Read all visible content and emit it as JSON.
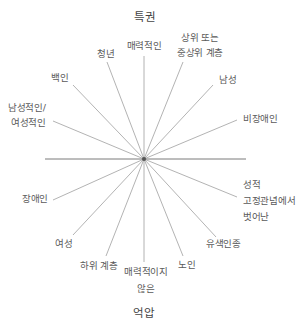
{
  "axis": {
    "top": "특권",
    "bottom": "억압"
  },
  "labels": {
    "attractive": "매력적인",
    "young": "청년",
    "upper_class_line1": "상위 또는",
    "upper_class_line2": "중상위 계층",
    "white": "백인",
    "male": "남성",
    "gender_normative_line1": "남성적인/",
    "gender_normative_line2": "여성적인",
    "non_disabled": "비장애인",
    "disabled": "장애인",
    "gender_nonconforming_line1": "성적",
    "gender_nonconforming_line2": "고정관념에서",
    "gender_nonconforming_line3": "벗어난",
    "female": "여성",
    "people_of_color": "유색인종",
    "lower_class": "하위 계층",
    "unattractive_line1": "매력적이지",
    "unattractive_line2": "않은",
    "elderly": "노인"
  },
  "colors": {
    "line": "#9a9a9a",
    "axis_line": "#7a7a7a",
    "text": "#5a5a5a"
  }
}
